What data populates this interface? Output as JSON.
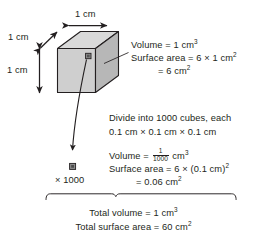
{
  "diagram": {
    "colors": {
      "ink": "#231f20",
      "cube_top": "#d9d9d9",
      "cube_front": "#c9c9c9",
      "cube_side": "#b3b3b3",
      "outline": "#231f20",
      "background": "#ffffff"
    },
    "dimension_labels": {
      "width": "1 cm",
      "depth": "1 cm",
      "height": "1 cm"
    },
    "big_cube_annotation": {
      "line1_prefix": "Volume = 1 cm",
      "line1_sup": "3",
      "line2_prefix": "Surface area = 6 × 1 cm",
      "line2_sup": "2",
      "line3_prefix": "= 6 cm",
      "line3_sup": "2"
    },
    "divide_note": {
      "line1": "Divide into 1000 cubes, each",
      "line2": "0.1 cm × 0.1 cm × 0.1 cm"
    },
    "small_cube_annotation": {
      "volume_label": "Volume = ",
      "volume_num": "1",
      "volume_den": "1000",
      "volume_unit": " cm",
      "volume_sup": "3",
      "line2_prefix": "Surface area = 6 × (0.1 cm)",
      "line2_sup": "2",
      "line3_prefix": "= 0.06 cm",
      "line3_sup": "2"
    },
    "multiplier_label": "× 1000",
    "totals": {
      "line1_prefix": "Total volume = 1 cm",
      "line1_sup": "3",
      "line2_prefix": "Total surface area = 60 cm",
      "line2_sup": "2"
    }
  }
}
